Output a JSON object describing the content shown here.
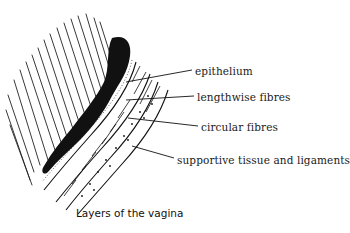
{
  "figure": {
    "caption": "Layers of the vagina",
    "labels": [
      {
        "id": "epithelium",
        "text": "epithelium",
        "x": 195,
        "y": 66
      },
      {
        "id": "lengthwise",
        "text": "lengthwise fibres",
        "x": 197,
        "y": 92
      },
      {
        "id": "circular",
        "text": "circular fibres",
        "x": 201,
        "y": 122
      },
      {
        "id": "supportive",
        "text": "supportive tissue and ligaments",
        "x": 177,
        "y": 155
      }
    ],
    "colors": {
      "ink": "#111111",
      "background": "#ffffff"
    }
  }
}
